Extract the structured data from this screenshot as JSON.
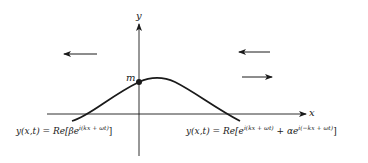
{
  "diagram": {
    "axes": {
      "x_label": "x",
      "y_label": "y"
    },
    "point": {
      "label": "m"
    },
    "arrows": [
      {
        "id": "left-incident",
        "direction": "left"
      },
      {
        "id": "right-upper",
        "direction": "left"
      },
      {
        "id": "right-lower",
        "direction": "right"
      }
    ],
    "equations": {
      "left": {
        "lhs": "y(x,t)",
        "eq": " = ",
        "re": "Re[",
        "coef": "β",
        "base": "e",
        "exp": "i(kx + ωt)",
        "close": "]"
      },
      "right": {
        "lhs": "y(x,t)",
        "eq": " = ",
        "re": "Re[",
        "base1": "e",
        "exp1": "i(kx + ωt)",
        "plus": " + ",
        "coef": "α",
        "base2": "e",
        "exp2": "i(−kx + ωt)",
        "close": "]"
      }
    },
    "colors": {
      "ink": "#1a1a1a",
      "background": "#ffffff"
    }
  }
}
